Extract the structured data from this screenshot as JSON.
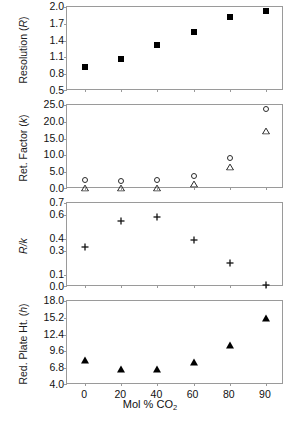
{
  "figure": {
    "xlabel_prefix": "Mol % CO",
    "xlabel_sub": "2"
  },
  "chart_data": [
    {
      "type": "scatter",
      "panel_index": 0,
      "title": "",
      "ylabel": "Resolution (R)",
      "ylabel_plain": "Resolution",
      "ylabel_symbol": "R",
      "xlabel": "Mol % CO2",
      "categories": [
        "0",
        "20",
        "40",
        "60",
        "80",
        "90"
      ],
      "x": [
        0,
        20,
        40,
        60,
        80,
        90
      ],
      "yticks": [
        0.5,
        0.8,
        1.1,
        1.4,
        1.7,
        2.0
      ],
      "yticklabels": [
        "0.5",
        "0.8",
        "1.1",
        "1.4",
        "1.7",
        "2.0"
      ],
      "ylim": [
        0.5,
        2.0
      ],
      "grid": false,
      "legend": "none",
      "series": [
        {
          "name": "Resolution",
          "marker": "filled-square",
          "values": [
            0.92,
            1.08,
            1.33,
            1.55,
            1.82,
            1.92
          ]
        }
      ]
    },
    {
      "type": "scatter",
      "panel_index": 1,
      "title": "",
      "ylabel": "Ret. Factor (k)",
      "ylabel_plain": "Ret. Factor",
      "ylabel_symbol": "k",
      "xlabel": "Mol % CO2",
      "categories": [
        "0",
        "20",
        "40",
        "60",
        "80",
        "90"
      ],
      "x": [
        0,
        20,
        40,
        60,
        80,
        90
      ],
      "yticks": [
        0.0,
        5.0,
        10.0,
        15.0,
        20.0,
        25.0
      ],
      "yticklabels": [
        "0.0",
        "5.0",
        "10.0",
        "15.0",
        "20.0",
        "25.0"
      ],
      "ylim": [
        0.0,
        25.0
      ],
      "grid": false,
      "legend": "none",
      "series": [
        {
          "name": "k (open circle)",
          "marker": "open-circle",
          "values": [
            2.7,
            2.4,
            2.6,
            3.9,
            9.3,
            23.9
          ]
        },
        {
          "name": "k (open triangle)",
          "marker": "open-triangle",
          "values": [
            2.5,
            2.3,
            2.5,
            3.6,
            8.6,
            19.4
          ]
        }
      ]
    },
    {
      "type": "scatter",
      "panel_index": 2,
      "title": "",
      "ylabel": "R/k",
      "ylabel_plain": "R/k",
      "ylabel_symbol": "R/k",
      "xlabel": "Mol % CO2",
      "categories": [
        "0",
        "20",
        "40",
        "60",
        "80",
        "90"
      ],
      "x": [
        0,
        20,
        40,
        60,
        80,
        90
      ],
      "yticks": [
        0.0,
        0.1,
        0.3,
        0.4,
        0.6,
        0.7
      ],
      "yticklabels": [
        "0.0",
        "0.1",
        "0.3",
        "0.4",
        "0.6",
        "0.7"
      ],
      "ylim": [
        0.0,
        0.7
      ],
      "grid": false,
      "legend": "none",
      "series": [
        {
          "name": "R/k",
          "marker": "plus",
          "values": [
            0.38,
            0.6,
            0.63,
            0.44,
            0.25,
            0.07
          ]
        }
      ]
    },
    {
      "type": "scatter",
      "panel_index": 3,
      "title": "",
      "ylabel": "Red. Plate Ht. (h)",
      "ylabel_plain": "Red. Plate Ht.",
      "ylabel_symbol": "h",
      "xlabel": "Mol % CO2",
      "categories": [
        "0",
        "20",
        "40",
        "60",
        "80",
        "90"
      ],
      "x": [
        0,
        20,
        40,
        60,
        80,
        90
      ],
      "yticks": [
        4.0,
        6.8,
        9.6,
        12.4,
        15.2,
        18.0
      ],
      "yticklabels": [
        "4.0",
        "6.8",
        "9.6",
        "12.4",
        "15.2",
        "18.0"
      ],
      "ylim": [
        4.0,
        18.0
      ],
      "grid": false,
      "legend": "none",
      "series": [
        {
          "name": "Reduced plate height",
          "marker": "filled-triangle",
          "values": [
            8.2,
            6.6,
            6.6,
            7.8,
            10.6,
            15.2
          ]
        }
      ]
    }
  ]
}
